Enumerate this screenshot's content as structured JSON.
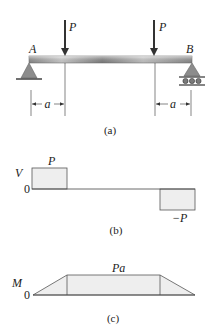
{
  "figure_a": {
    "caption": "(a)",
    "load_left_label": "P",
    "load_right_label": "P",
    "support_left_label": "A",
    "support_right_label": "B",
    "dim_left_label": "a",
    "dim_right_label": "a"
  },
  "figure_b": {
    "caption": "(b)",
    "axis_label": "V",
    "zero_label": "0",
    "positive_label": "P",
    "negative_label": "−P"
  },
  "figure_c": {
    "caption": "(c)",
    "axis_label": "M",
    "zero_label": "0",
    "max_label": "Pa"
  },
  "colors": {
    "fill": "#eeeeee",
    "stroke": "#444444",
    "beam_dark": "#8a8a8a",
    "beam_light": "#e6e6e6",
    "support": "#8c8c8c"
  }
}
